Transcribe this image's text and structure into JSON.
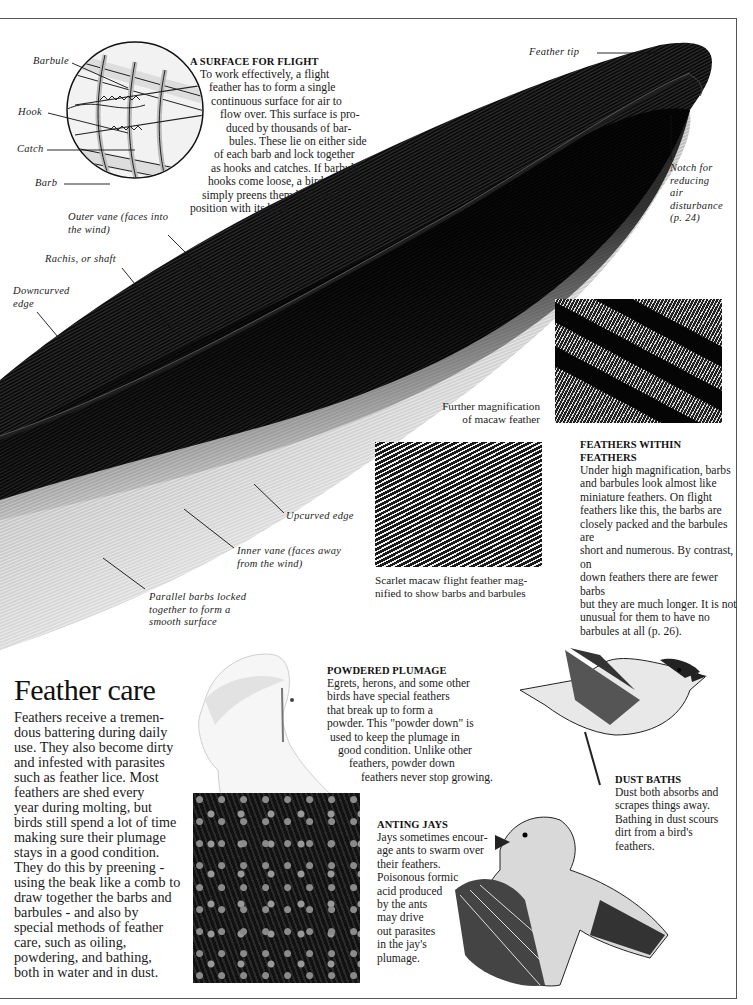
{
  "page": {
    "section_title": "Feather care",
    "section_body": "Feathers receive a tremendous battering during daily use. They also become dirty and infested with parasites such as feather lice. Most feathers are shed every year during molting, but birds still spend a lot of time making sure their plumage stays in a good condition. They do this by preening - using the beak like a comb to draw together the barbs and barbules - and also by special methods of feather care, such as oiling, powdering, and bathing, both in water and in dust.",
    "section_body_lines": [
      "Feathers receive a tremen-",
      "dous battering during daily",
      "use. They also become dirty",
      "and infested with parasites",
      "such as feather lice. Most",
      "feathers are shed every",
      "year during molting, but",
      "birds still spend a lot of time",
      "making sure their plumage",
      "stays in a good condition.",
      "They do this by preening -",
      "using the beak like a comb to",
      "draw together the barbs and",
      "barbules - and also by",
      "special methods of feather",
      "care, such as oiling,",
      "powdering, and bathing,",
      "both in water and in dust."
    ]
  },
  "surface_for_flight": {
    "heading": "A SURFACE FOR FLIGHT",
    "lines": [
      "To work effectively, a flight",
      "feather has to form a single",
      "continuous surface for air to",
      "flow over. This surface is pro-",
      "duced by thousands of bar-",
      "bules. These lie on either side",
      "of each barb and lock together",
      "as hooks and catches. If barbule",
      "hooks come loose, a bird",
      "simply preens them back into",
      "position with its beak."
    ]
  },
  "barb_diagram_labels": {
    "barbule": "Barbule",
    "hook": "Hook",
    "catch": "Catch",
    "barb": "Barb"
  },
  "feather_labels": {
    "feather_tip": "Feather tip",
    "notch": [
      "Notch for",
      "reducing",
      "air",
      "disturbance",
      "(p. 24)"
    ],
    "outer_vane": [
      "Outer vane (faces into",
      "the wind)"
    ],
    "rachis": "Rachis, or shaft",
    "downcurved": [
      "Downcurved",
      "edge"
    ],
    "upcurved": "Upcurved edge",
    "inner_vane": [
      "Inner vane (faces away",
      "from the wind)"
    ],
    "parallel_barbs": [
      "Parallel barbs locked",
      "together to form a",
      "smooth surface"
    ]
  },
  "magnification": {
    "further_caption": [
      "Further magnification",
      "of macaw feather"
    ],
    "scarlet_caption": [
      "Scarlet macaw flight feather mag-",
      "nified to show barbs and barbules"
    ]
  },
  "feathers_within_feathers": {
    "heading": "FEATHERS WITHIN FEATHERS",
    "lines": [
      "Under high magnification, barbs",
      "and barbules look almost like",
      "miniature feathers. On flight",
      "feathers like this, the barbs are",
      "closely packed and the barbules are",
      "short and numerous. By contrast, on",
      "down feathers there are fewer barbs",
      "but they are much longer. It is not",
      "unusual for them to have no",
      "barbules at all (p. 26)."
    ]
  },
  "powdered_plumage": {
    "heading": "POWDERED PLUMAGE",
    "lines": [
      "Egrets, herons, and some other",
      "birds have special feathers",
      "that break up to form a",
      "powder. This \"powder down\" is",
      "used to keep the plumage in",
      "good condition. Unlike other",
      "feathers, powder down",
      "feathers never stop growing."
    ]
  },
  "dust_baths": {
    "heading": "DUST BATHS",
    "lines": [
      "Dust both absorbs and",
      "scrapes things away.",
      "Bathing in dust scours",
      "dirt from a bird's",
      "feathers."
    ]
  },
  "anting_jays": {
    "heading": "ANTING JAYS",
    "lines": [
      "Jays sometimes encour-",
      "age ants to swarm over",
      "their  feathers.",
      "Poisonous formic",
      "acid produced",
      "by the ants",
      "may drive",
      "out parasites",
      "in the jay's",
      "plumage."
    ]
  },
  "colors": {
    "feather_dark": "#0b0b0b",
    "feather_mid": "#5a5a5a",
    "text": "#1a1a1a",
    "frame": "#555555",
    "background": "#ffffff"
  }
}
